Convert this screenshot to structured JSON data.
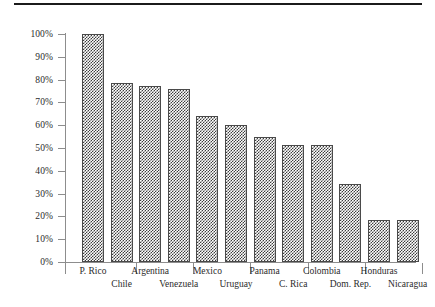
{
  "chart_data": {
    "type": "bar",
    "title": "",
    "subtitle": "",
    "xlabel": "",
    "ylabel": "",
    "ylim": [
      0,
      100
    ],
    "grid": false,
    "legend": "none",
    "y_tick_labels": [
      "100%",
      "90%",
      "80%",
      "70%",
      "60%",
      "50%",
      "40%",
      "30%",
      "20%",
      "10%",
      "0%"
    ],
    "y_tick_values": [
      100,
      90,
      80,
      70,
      60,
      50,
      40,
      30,
      20,
      10,
      0
    ],
    "categories": [
      "P. Rico",
      "Chile",
      "Argentina",
      "Venezuela",
      "Mexico",
      "Uruguay",
      "Panama",
      "C. Rica",
      "Colombia",
      "Dom. Rep.",
      "Honduras",
      "Nicaragua"
    ],
    "values": [
      100,
      78.5,
      77,
      76,
      64,
      60,
      55,
      51.5,
      51.5,
      34,
      18.5,
      18.5
    ],
    "value_unit": "%",
    "bar_fill": "checkerboard-hatch",
    "bar_fill_color": "#3d3d3d",
    "bar_border_color": "#4a4a4a",
    "axis_color": "#8d8d8d",
    "text_color": "#2b2b2b"
  },
  "decor": {
    "top_rule": "horizontal-rule"
  }
}
